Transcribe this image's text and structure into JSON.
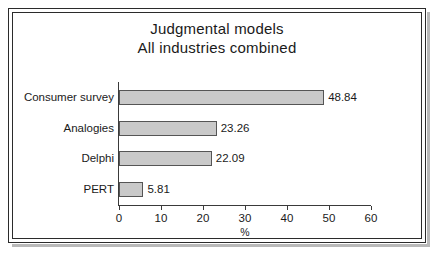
{
  "chart_data": {
    "type": "bar",
    "orientation": "horizontal",
    "title": "Judgmental models",
    "subtitle": "All industries combined",
    "categories": [
      "Consumer survey",
      "Analogies",
      "Delphi",
      "PERT"
    ],
    "values": [
      48.84,
      23.26,
      22.09,
      5.81
    ],
    "value_labels": [
      "48.84",
      "23.26",
      "22.09",
      "5.81"
    ],
    "xlabel": "%",
    "ylabel": "",
    "xlim": [
      0,
      60
    ],
    "xticks": [
      0,
      10,
      20,
      30,
      40,
      50,
      60
    ],
    "xtick_labels": [
      "0",
      "10",
      "20",
      "30",
      "40",
      "50",
      "60"
    ],
    "grid": false,
    "legend": false,
    "colors": {
      "bar_fill": "#c9c9c9",
      "bar_stroke": "#555555",
      "axis": "#3a3a3a",
      "text": "#1a1a1a",
      "background": "#ffffff",
      "frame": "#2b2b2b",
      "frame_shadow": "#b9b9b9"
    }
  }
}
